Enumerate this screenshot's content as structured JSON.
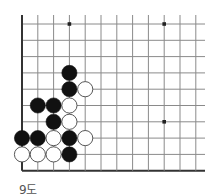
{
  "caption": "9도",
  "board": {
    "cols": 12,
    "rows": 10,
    "origin_x": 22,
    "origin_y": 24,
    "step_x": 15.8,
    "step_y": 16.3,
    "right_extent": 205,
    "top_extent": 15,
    "edges": [
      "left",
      "bottom"
    ],
    "line_color": "#8a8a8a",
    "edge_color": "#333333",
    "hoshi": [
      [
        3,
        0
      ],
      [
        9,
        0
      ],
      [
        9,
        6
      ]
    ],
    "stones": [
      {
        "col": 3,
        "row": 3,
        "color": "black"
      },
      {
        "col": 3,
        "row": 4,
        "color": "black"
      },
      {
        "col": 4,
        "row": 4,
        "color": "white"
      },
      {
        "col": 1,
        "row": 5,
        "color": "black"
      },
      {
        "col": 2,
        "row": 5,
        "color": "black"
      },
      {
        "col": 3,
        "row": 5,
        "color": "white"
      },
      {
        "col": 2,
        "row": 6,
        "color": "black"
      },
      {
        "col": 3,
        "row": 6,
        "color": "white"
      },
      {
        "col": 0,
        "row": 7,
        "color": "black"
      },
      {
        "col": 1,
        "row": 7,
        "color": "black"
      },
      {
        "col": 2,
        "row": 7,
        "color": "white"
      },
      {
        "col": 3,
        "row": 7,
        "color": "black"
      },
      {
        "col": 4,
        "row": 7,
        "color": "white"
      },
      {
        "col": 0,
        "row": 8,
        "color": "white"
      },
      {
        "col": 1,
        "row": 8,
        "color": "white"
      },
      {
        "col": 2,
        "row": 8,
        "color": "white"
      },
      {
        "col": 3,
        "row": 8,
        "color": "black"
      }
    ]
  }
}
